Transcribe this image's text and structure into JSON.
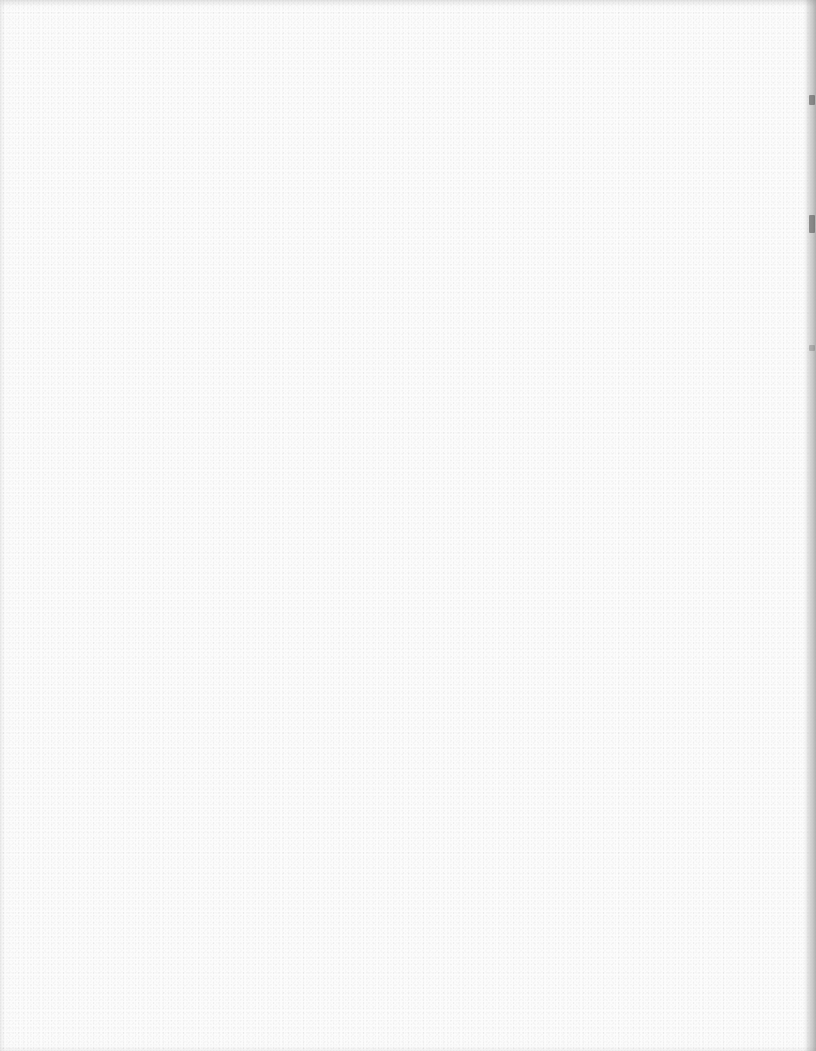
{
  "document": {
    "type": "scanned-page",
    "content": "",
    "is_blank": true
  },
  "colors": {
    "paper": "#fcfcfc",
    "edge_shadow": "#aaaaaa"
  }
}
